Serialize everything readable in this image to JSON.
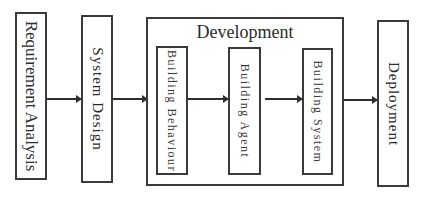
{
  "diagram": {
    "type": "process-flow",
    "direction": "left-to-right",
    "stages": [
      {
        "id": "requirement",
        "label": "Requirement Analysis"
      },
      {
        "id": "system-design",
        "label": "System Design"
      },
      {
        "id": "development",
        "label": "Development",
        "children": [
          {
            "id": "building-behaviour",
            "label": "Building Behaviour"
          },
          {
            "id": "building-agent",
            "label": "Building Agent"
          },
          {
            "id": "building-system",
            "label": "Building System"
          }
        ]
      },
      {
        "id": "deployment",
        "label": "Deployment"
      }
    ],
    "edges": [
      {
        "from": "Requirement Analysis",
        "to": "System Design"
      },
      {
        "from": "System Design",
        "to": "Development"
      },
      {
        "from": "Building Behaviour",
        "to": "Building Agent"
      },
      {
        "from": "Building Agent",
        "to": "Building System"
      },
      {
        "from": "Development",
        "to": "Deployment"
      }
    ],
    "colors": {
      "line": "#3a3a3a",
      "text": "#2b2b2b",
      "background": "#ffffff"
    }
  }
}
